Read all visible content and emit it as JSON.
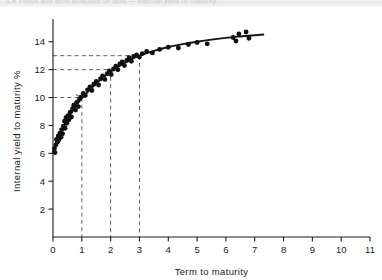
{
  "page": {
    "top_strip_text": "1.4  Yields and term structure of debt — internal yield to maturity"
  },
  "figure": {
    "y_axis_title": "Internal yield to maturity %",
    "x_axis_title": "Term to maturity"
  },
  "chart_data": {
    "type": "scatter",
    "title": "",
    "subtitle": "",
    "xlabel": "Term to maturity",
    "ylabel": "Internal yield to maturity %",
    "xlim": [
      0,
      11
    ],
    "ylim": [
      0,
      15.2
    ],
    "xticks": [
      0,
      1,
      2,
      3,
      4,
      5,
      6,
      7,
      8,
      9,
      10,
      11
    ],
    "xtick_labels": [
      "0",
      "1",
      "2",
      "3",
      "4",
      "5",
      "6",
      "7",
      "8",
      "9",
      "10",
      "11"
    ],
    "yticks": [
      2,
      4,
      6,
      8,
      10,
      12,
      14
    ],
    "ytick_labels": [
      "2",
      "4",
      "6",
      "8",
      "10",
      "12",
      "14"
    ],
    "grid": false,
    "legend": null,
    "series": [
      {
        "name": "Bond observations",
        "marker": "filled-circle",
        "color": "#111111",
        "points": [
          [
            0.05,
            6.35
          ],
          [
            0.07,
            6.05
          ],
          [
            0.1,
            6.6
          ],
          [
            0.12,
            7.0
          ],
          [
            0.15,
            6.8
          ],
          [
            0.18,
            7.25
          ],
          [
            0.2,
            6.95
          ],
          [
            0.24,
            7.45
          ],
          [
            0.28,
            7.15
          ],
          [
            0.3,
            7.7
          ],
          [
            0.33,
            7.4
          ],
          [
            0.36,
            7.95
          ],
          [
            0.4,
            8.3
          ],
          [
            0.42,
            7.8
          ],
          [
            0.45,
            8.55
          ],
          [
            0.48,
            8.15
          ],
          [
            0.52,
            8.7
          ],
          [
            0.55,
            8.4
          ],
          [
            0.6,
            8.95
          ],
          [
            0.64,
            8.6
          ],
          [
            0.68,
            9.2
          ],
          [
            0.72,
            9.45
          ],
          [
            0.78,
            9.1
          ],
          [
            0.82,
            9.65
          ],
          [
            0.88,
            9.35
          ],
          [
            0.92,
            9.9
          ],
          [
            0.98,
            10.05
          ],
          [
            1.05,
            10.3
          ],
          [
            1.12,
            10.15
          ],
          [
            1.2,
            10.55
          ],
          [
            1.28,
            10.75
          ],
          [
            1.35,
            10.5
          ],
          [
            1.42,
            10.95
          ],
          [
            1.5,
            11.15
          ],
          [
            1.58,
            10.9
          ],
          [
            1.65,
            11.35
          ],
          [
            1.72,
            11.55
          ],
          [
            1.8,
            11.3
          ],
          [
            1.88,
            11.7
          ],
          [
            1.95,
            11.9
          ],
          [
            2.02,
            11.65
          ],
          [
            2.1,
            12.05
          ],
          [
            2.18,
            12.25
          ],
          [
            2.25,
            12.0
          ],
          [
            2.32,
            12.4
          ],
          [
            2.4,
            12.55
          ],
          [
            2.48,
            12.3
          ],
          [
            2.56,
            12.65
          ],
          [
            2.64,
            12.85
          ],
          [
            2.72,
            12.6
          ],
          [
            2.8,
            12.95
          ],
          [
            2.9,
            13.05
          ],
          [
            3.0,
            12.9
          ],
          [
            3.1,
            13.15
          ],
          [
            3.25,
            13.3
          ],
          [
            3.45,
            13.2
          ],
          [
            3.7,
            13.45
          ],
          [
            4.0,
            13.6
          ],
          [
            4.35,
            13.55
          ],
          [
            4.7,
            13.8
          ],
          [
            5.0,
            13.95
          ],
          [
            5.35,
            13.85
          ],
          [
            6.25,
            14.3
          ],
          [
            6.35,
            14.05
          ],
          [
            6.45,
            14.55
          ],
          [
            6.7,
            14.7
          ],
          [
            6.8,
            14.25
          ]
        ]
      },
      {
        "name": "Fitted yield curve",
        "marker": "line",
        "color": "#141414",
        "points": [
          [
            0.0,
            6.1
          ],
          [
            0.25,
            7.45
          ],
          [
            0.5,
            8.45
          ],
          [
            0.75,
            9.25
          ],
          [
            1.0,
            9.95
          ],
          [
            1.25,
            10.5
          ],
          [
            1.5,
            11.0
          ],
          [
            1.75,
            11.45
          ],
          [
            2.0,
            11.85
          ],
          [
            2.25,
            12.2
          ],
          [
            2.5,
            12.5
          ],
          [
            2.75,
            12.78
          ],
          [
            3.0,
            13.0
          ],
          [
            3.5,
            13.35
          ],
          [
            4.0,
            13.62
          ],
          [
            4.5,
            13.83
          ],
          [
            5.0,
            14.0
          ],
          [
            5.5,
            14.15
          ],
          [
            6.0,
            14.28
          ],
          [
            6.5,
            14.38
          ],
          [
            7.0,
            14.47
          ],
          [
            7.3,
            14.52
          ]
        ]
      }
    ],
    "annotations": [
      {
        "name": "guide-1yr",
        "x": 1,
        "y": 10,
        "note": "dashed guide from y=10 to x=1"
      },
      {
        "name": "guide-2yr",
        "x": 2,
        "y": 12,
        "note": "dashed guide from y=12 to x=2"
      },
      {
        "name": "guide-3yr",
        "x": 3,
        "y": 13,
        "note": "dashed guide from y=13 to x=3"
      }
    ]
  }
}
